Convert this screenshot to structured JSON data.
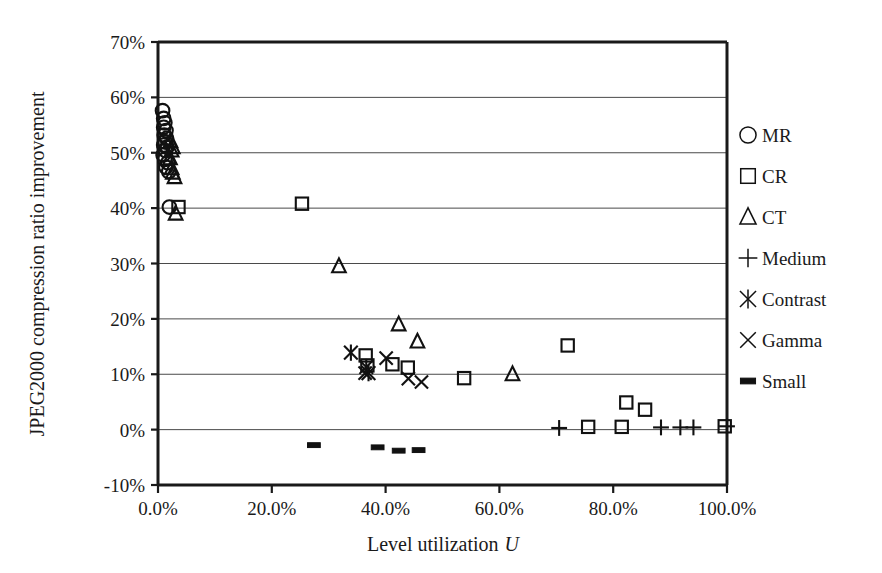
{
  "chart_data": {
    "type": "scatter",
    "title": "",
    "xlabel": "Level utilization U",
    "ylabel": "JPEG2000 compression ratio improvement",
    "xlim": [
      0,
      100
    ],
    "ylim": [
      -10,
      70
    ],
    "xticks": [
      "0.0%",
      "20.0%",
      "40.0%",
      "60.0%",
      "80.0%",
      "100.0%"
    ],
    "xtick_values": [
      0,
      20,
      40,
      60,
      80,
      100
    ],
    "yticks": [
      "-10%",
      "0%",
      "10%",
      "20%",
      "30%",
      "40%",
      "50%",
      "60%",
      "70%"
    ],
    "ytick_values": [
      -10,
      0,
      10,
      20,
      30,
      40,
      50,
      60,
      70
    ],
    "grid": "horizontal",
    "legend_position": "right",
    "series": [
      {
        "name": "MR",
        "marker": "circle",
        "points": [
          [
            0.8,
            57.6
          ],
          [
            1.0,
            56.2
          ],
          [
            1.2,
            55.4
          ],
          [
            1.0,
            54.6
          ],
          [
            1.4,
            54.0
          ],
          [
            1.1,
            53.2
          ],
          [
            1.5,
            52.6
          ],
          [
            1.2,
            52.0
          ],
          [
            1.0,
            51.4
          ],
          [
            1.6,
            51.0
          ],
          [
            1.3,
            50.4
          ],
          [
            0.9,
            49.6
          ],
          [
            1.2,
            48.8
          ],
          [
            1.7,
            48.2
          ],
          [
            1.4,
            47.4
          ],
          [
            1.9,
            46.6
          ],
          [
            2.0,
            40.2
          ]
        ]
      },
      {
        "name": "CR",
        "marker": "square",
        "points": [
          [
            3.6,
            40.2
          ],
          [
            25.3,
            40.8
          ],
          [
            36.5,
            13.4
          ],
          [
            36.8,
            11.6
          ],
          [
            41.2,
            11.8
          ],
          [
            43.9,
            11.2
          ],
          [
            53.8,
            9.3
          ],
          [
            72.0,
            15.2
          ],
          [
            82.3,
            4.9
          ],
          [
            85.6,
            3.6
          ],
          [
            75.6,
            0.5
          ],
          [
            81.5,
            0.5
          ],
          [
            99.6,
            0.6
          ]
        ]
      },
      {
        "name": "CT",
        "marker": "triangle",
        "points": [
          [
            2.2,
            52.1
          ],
          [
            2.6,
            51.0
          ],
          [
            2.4,
            50.4
          ],
          [
            2.1,
            49.0
          ],
          [
            2.4,
            47.2
          ],
          [
            2.6,
            46.4
          ],
          [
            2.9,
            45.6
          ],
          [
            3.1,
            39.0
          ],
          [
            31.8,
            29.5
          ],
          [
            42.3,
            19.0
          ],
          [
            45.6,
            15.9
          ],
          [
            62.3,
            10.0
          ]
        ]
      },
      {
        "name": "Medium",
        "marker": "plus",
        "points": [
          [
            70.5,
            0.3
          ],
          [
            88.4,
            0.4
          ],
          [
            91.8,
            0.4
          ],
          [
            94.1,
            0.4
          ],
          [
            100.0,
            0.6
          ]
        ]
      },
      {
        "name": "Contrast",
        "marker": "asterisk",
        "points": [
          [
            33.9,
            13.9
          ],
          [
            36.6,
            11.3
          ],
          [
            37.0,
            10.2
          ]
        ]
      },
      {
        "name": "Gamma",
        "marker": "cross",
        "points": [
          [
            36.4,
            10.2
          ],
          [
            40.1,
            12.9
          ],
          [
            44.0,
            9.2
          ],
          [
            46.3,
            8.6
          ]
        ]
      },
      {
        "name": "Small",
        "marker": "dash",
        "points": [
          [
            27.4,
            -2.8
          ],
          [
            38.6,
            -3.2
          ],
          [
            42.3,
            -3.8
          ],
          [
            45.8,
            -3.7
          ]
        ]
      }
    ]
  },
  "legend": {
    "entries": [
      {
        "label": "MR",
        "marker": "circle"
      },
      {
        "label": "CR",
        "marker": "square"
      },
      {
        "label": "CT",
        "marker": "triangle"
      },
      {
        "label": "Medium",
        "marker": "plus"
      },
      {
        "label": "Contrast",
        "marker": "asterisk"
      },
      {
        "label": "Gamma",
        "marker": "cross"
      },
      {
        "label": "Small",
        "marker": "dash"
      }
    ]
  },
  "colors": {
    "marker": "#111111",
    "axis": "#1a1a1a",
    "grid": "#4a4a4a",
    "background": "#ffffff"
  }
}
